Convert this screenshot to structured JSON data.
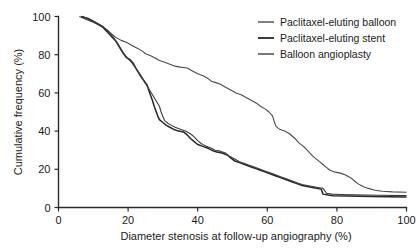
{
  "chart_data": {
    "type": "line",
    "title": "",
    "xlabel": "Diameter stenosis at follow-up angiography (%)",
    "ylabel": "Cumulative frequency (%)",
    "xlim": [
      0,
      100
    ],
    "ylim": [
      0,
      100
    ],
    "xticks": [
      0,
      20,
      40,
      60,
      80,
      100
    ],
    "yticks": [
      0,
      20,
      40,
      60,
      80,
      100
    ],
    "grid": false,
    "legend_position": "top-right",
    "series": [
      {
        "name": "Paclitaxel-eluting balloon",
        "color": "#4a4a4a",
        "width": 1.1,
        "points": [
          [
            6.0,
            100.0
          ],
          [
            8.0,
            98.5
          ],
          [
            10.0,
            97.0
          ],
          [
            11.5,
            95.5
          ],
          [
            13.0,
            94.0
          ],
          [
            14.5,
            92.0
          ],
          [
            15.5,
            90.5
          ],
          [
            16.5,
            89.0
          ],
          [
            18.0,
            87.5
          ],
          [
            19.5,
            86.5
          ],
          [
            21.0,
            85.0
          ],
          [
            22.5,
            83.5
          ],
          [
            24.0,
            82.0
          ],
          [
            25.0,
            80.5
          ],
          [
            26.5,
            79.5
          ],
          [
            28.0,
            78.0
          ],
          [
            29.0,
            77.0
          ],
          [
            30.5,
            76.0
          ],
          [
            32.0,
            75.0
          ],
          [
            33.5,
            74.0
          ],
          [
            35.0,
            73.5
          ],
          [
            37.0,
            73.0
          ],
          [
            38.5,
            71.5
          ],
          [
            40.0,
            70.0
          ],
          [
            41.5,
            69.0
          ],
          [
            43.0,
            67.5
          ],
          [
            44.0,
            66.0
          ],
          [
            45.0,
            65.5
          ],
          [
            46.5,
            64.5
          ],
          [
            48.0,
            63.0
          ],
          [
            49.5,
            61.5
          ],
          [
            51.0,
            60.0
          ],
          [
            52.5,
            59.0
          ],
          [
            54.0,
            57.5
          ],
          [
            55.5,
            56.0
          ],
          [
            57.0,
            54.5
          ],
          [
            58.0,
            53.0
          ],
          [
            59.5,
            51.5
          ],
          [
            60.5,
            50.0
          ],
          [
            61.5,
            48.0
          ],
          [
            62.0,
            45.0
          ],
          [
            62.5,
            42.5
          ],
          [
            63.5,
            41.0
          ],
          [
            65.0,
            40.0
          ],
          [
            66.5,
            38.5
          ],
          [
            68.0,
            36.0
          ],
          [
            69.0,
            34.0
          ],
          [
            70.0,
            32.5
          ],
          [
            71.0,
            31.0
          ],
          [
            72.0,
            29.0
          ],
          [
            73.0,
            27.0
          ],
          [
            74.0,
            25.5
          ],
          [
            75.0,
            24.0
          ],
          [
            76.0,
            22.5
          ],
          [
            77.0,
            21.0
          ],
          [
            78.0,
            19.5
          ],
          [
            79.5,
            18.5
          ],
          [
            81.0,
            18.0
          ],
          [
            82.5,
            17.0
          ],
          [
            84.0,
            15.5
          ],
          [
            85.0,
            14.0
          ],
          [
            86.0,
            12.5
          ],
          [
            87.5,
            11.0
          ],
          [
            89.0,
            10.0
          ],
          [
            91.0,
            9.0
          ],
          [
            93.0,
            8.5
          ],
          [
            96.0,
            8.2
          ],
          [
            100.0,
            8.0
          ]
        ]
      },
      {
        "name": "Paclitaxel-eluting stent",
        "color": "#262626",
        "width": 1.5,
        "points": [
          [
            6.5,
            100.0
          ],
          [
            8.5,
            99.0
          ],
          [
            10.0,
            97.5
          ],
          [
            11.5,
            96.0
          ],
          [
            12.5,
            95.0
          ],
          [
            13.5,
            93.0
          ],
          [
            14.5,
            91.0
          ],
          [
            15.5,
            89.0
          ],
          [
            16.5,
            87.0
          ],
          [
            17.5,
            84.0
          ],
          [
            18.5,
            81.0
          ],
          [
            19.5,
            78.5
          ],
          [
            20.5,
            77.5
          ],
          [
            21.5,
            75.5
          ],
          [
            22.5,
            72.0
          ],
          [
            23.5,
            69.0
          ],
          [
            24.5,
            66.5
          ],
          [
            25.5,
            64.0
          ],
          [
            26.0,
            61.0
          ],
          [
            26.5,
            58.5
          ],
          [
            27.0,
            56.0
          ],
          [
            27.5,
            53.0
          ],
          [
            28.0,
            50.5
          ],
          [
            28.5,
            48.0
          ],
          [
            29.0,
            46.0
          ],
          [
            30.0,
            44.5
          ],
          [
            31.0,
            43.0
          ],
          [
            32.0,
            42.0
          ],
          [
            33.0,
            41.0
          ],
          [
            34.5,
            40.0
          ],
          [
            36.0,
            39.5
          ],
          [
            37.0,
            38.0
          ],
          [
            38.0,
            36.0
          ],
          [
            39.0,
            34.5
          ],
          [
            40.0,
            33.0
          ],
          [
            41.5,
            32.0
          ],
          [
            43.0,
            31.0
          ],
          [
            44.0,
            30.0
          ],
          [
            45.5,
            29.0
          ],
          [
            47.0,
            28.5
          ],
          [
            48.5,
            27.5
          ],
          [
            49.5,
            26.0
          ],
          [
            50.5,
            24.5
          ],
          [
            52.0,
            23.5
          ],
          [
            53.5,
            22.5
          ],
          [
            55.0,
            21.5
          ],
          [
            56.5,
            20.5
          ],
          [
            58.0,
            19.5
          ],
          [
            59.5,
            18.5
          ],
          [
            61.0,
            17.5
          ],
          [
            62.5,
            16.5
          ],
          [
            64.0,
            15.5
          ],
          [
            65.5,
            14.5
          ],
          [
            67.0,
            13.5
          ],
          [
            68.5,
            12.5
          ],
          [
            70.0,
            11.5
          ],
          [
            71.5,
            11.0
          ],
          [
            73.0,
            10.5
          ],
          [
            74.5,
            10.0
          ],
          [
            75.5,
            9.5
          ],
          [
            76.0,
            7.0
          ],
          [
            77.5,
            6.5
          ],
          [
            79.0,
            6.2
          ],
          [
            83.0,
            6.0
          ],
          [
            90.0,
            5.8
          ],
          [
            100.0,
            5.5
          ]
        ]
      },
      {
        "name": "Balloon angioplasty",
        "color": "#3d3d3d",
        "width": 1.1,
        "points": [
          [
            7.0,
            100.0
          ],
          [
            9.0,
            98.0
          ],
          [
            11.0,
            96.5
          ],
          [
            12.5,
            95.0
          ],
          [
            14.0,
            93.0
          ],
          [
            15.0,
            91.0
          ],
          [
            16.0,
            88.5
          ],
          [
            17.0,
            86.0
          ],
          [
            18.0,
            83.0
          ],
          [
            19.0,
            80.0
          ],
          [
            20.0,
            78.0
          ],
          [
            21.0,
            76.0
          ],
          [
            22.0,
            73.5
          ],
          [
            23.0,
            71.0
          ],
          [
            24.0,
            68.0
          ],
          [
            25.0,
            65.0
          ],
          [
            26.0,
            62.0
          ],
          [
            27.0,
            59.0
          ],
          [
            28.0,
            56.0
          ],
          [
            29.0,
            53.0
          ],
          [
            29.5,
            50.0
          ],
          [
            30.0,
            47.5
          ],
          [
            30.5,
            45.5
          ],
          [
            31.5,
            44.0
          ],
          [
            32.5,
            43.0
          ],
          [
            33.5,
            42.0
          ],
          [
            35.0,
            41.0
          ],
          [
            36.5,
            40.0
          ],
          [
            38.0,
            38.5
          ],
          [
            39.0,
            37.0
          ],
          [
            40.0,
            35.0
          ],
          [
            41.0,
            33.5
          ],
          [
            42.5,
            32.0
          ],
          [
            44.0,
            31.0
          ],
          [
            45.0,
            30.0
          ],
          [
            46.5,
            29.5
          ],
          [
            48.0,
            28.5
          ],
          [
            49.0,
            27.0
          ],
          [
            50.5,
            25.5
          ],
          [
            52.0,
            24.0
          ],
          [
            53.5,
            23.0
          ],
          [
            55.0,
            22.0
          ],
          [
            56.5,
            21.0
          ],
          [
            58.0,
            20.0
          ],
          [
            59.5,
            19.0
          ],
          [
            61.0,
            18.0
          ],
          [
            62.5,
            17.0
          ],
          [
            64.0,
            16.0
          ],
          [
            65.5,
            15.0
          ],
          [
            67.0,
            14.0
          ],
          [
            68.5,
            13.0
          ],
          [
            70.0,
            12.0
          ],
          [
            71.5,
            11.5
          ],
          [
            73.0,
            11.0
          ],
          [
            74.5,
            10.5
          ],
          [
            76.0,
            10.0
          ],
          [
            77.0,
            7.5
          ],
          [
            78.5,
            7.0
          ],
          [
            81.0,
            6.8
          ],
          [
            85.0,
            6.6
          ],
          [
            92.0,
            6.4
          ],
          [
            100.0,
            6.2
          ]
        ]
      }
    ]
  },
  "legend": {
    "items": [
      {
        "label": "Paclitaxel-eluting balloon"
      },
      {
        "label": "Paclitaxel-eluting stent"
      },
      {
        "label": "Balloon angioplasty"
      }
    ]
  },
  "axes": {
    "x_tick_labels": [
      "0",
      "20",
      "40",
      "60",
      "80",
      "100"
    ],
    "y_tick_labels": [
      "0",
      "20",
      "40",
      "60",
      "80",
      "100"
    ]
  }
}
